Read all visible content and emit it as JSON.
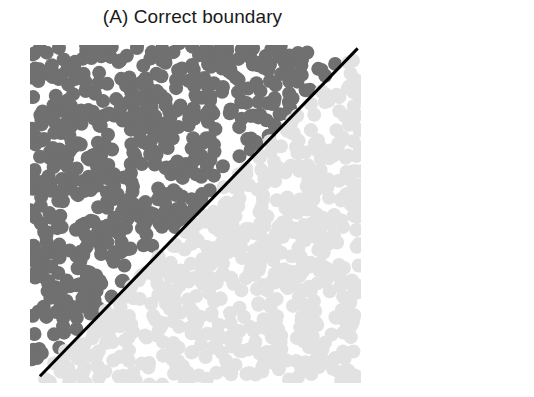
{
  "figure": {
    "title": "(A) Correct boundary",
    "background_color": "#ffffff",
    "width": 534,
    "height": 397
  },
  "chart_data": {
    "type": "scatter",
    "title": "(A) Correct boundary",
    "subtitle": "",
    "xlabel": "",
    "ylabel": "",
    "xlim": [
      0,
      1
    ],
    "ylim": [
      0,
      1
    ],
    "xticks": [],
    "yticks": [],
    "xticklabels": [],
    "yticklabels": [],
    "grid": false,
    "legend": false,
    "legend_position": "none",
    "axes_visible": false,
    "marker": "circle",
    "marker_size_px": 14,
    "plot_area": {
      "left": 30,
      "top": 45,
      "width": 331,
      "height": 338
    },
    "series": [
      {
        "name": "Class 1 (above boundary)",
        "color": "#707070",
        "region": "upper-left triangle",
        "n_points": 620,
        "description": "Dark gray points filling the region above the diagonal boundary y = x"
      },
      {
        "name": "Class 2 (below boundary)",
        "color": "#e2e2e2",
        "region": "lower-right triangle",
        "n_points": 620,
        "description": "Light gray points filling the region below the diagonal boundary y = x"
      }
    ],
    "annotations": [
      {
        "type": "line",
        "name": "decision-boundary",
        "label": "Correct boundary",
        "color": "#000000",
        "linewidth_px": 3,
        "x_start": 0.03,
        "y_start": 0.02,
        "x_end": 0.99,
        "y_end": 0.99,
        "slope": 1,
        "intercept": 0
      }
    ],
    "random_seed": 20240917,
    "point_jitter": 0.012
  }
}
